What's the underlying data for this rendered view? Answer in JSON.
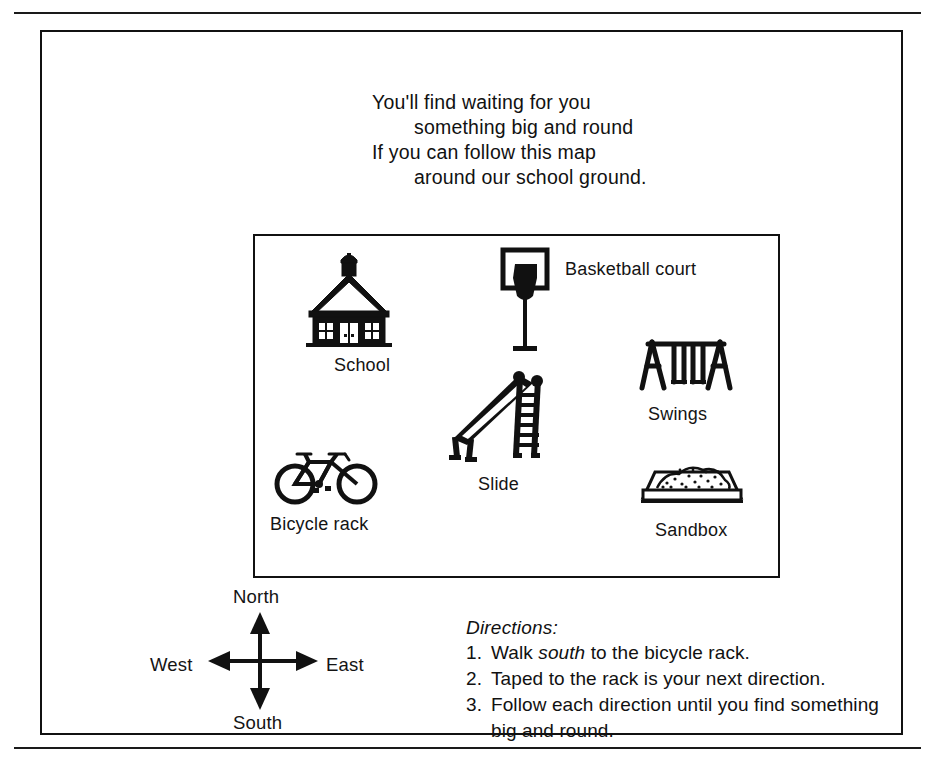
{
  "page": {
    "background_color": "#ffffff",
    "ink_color": "#111111"
  },
  "poem": {
    "lines": [
      "You'll find waiting for you",
      "something big and round",
      "If you can follow this map",
      "around our school ground."
    ]
  },
  "map": {
    "items": [
      {
        "id": "school",
        "label": "School",
        "icon": "schoolhouse-icon"
      },
      {
        "id": "basketball",
        "label": "Basketball court",
        "icon": "basketball-hoop-icon"
      },
      {
        "id": "swings",
        "label": "Swings",
        "icon": "swing-set-icon"
      },
      {
        "id": "slide",
        "label": "Slide",
        "icon": "playground-slide-icon"
      },
      {
        "id": "sandbox",
        "label": "Sandbox",
        "icon": "sandbox-icon"
      },
      {
        "id": "bicycle",
        "label": "Bicycle rack",
        "icon": "bicycle-icon"
      }
    ]
  },
  "compass": {
    "north": "North",
    "south": "South",
    "west": "West",
    "east": "East"
  },
  "directions": {
    "title": "Directions:",
    "items": [
      {
        "number": "1.",
        "text_before": "Walk ",
        "emphasis": "south",
        "text_after": " to the bicycle rack."
      },
      {
        "number": "2.",
        "text_before": "Taped to the rack is your next direction.",
        "emphasis": "",
        "text_after": ""
      },
      {
        "number": "3.",
        "text_before": "Follow each direction until you find something big and round.",
        "emphasis": "",
        "text_after": ""
      }
    ]
  }
}
